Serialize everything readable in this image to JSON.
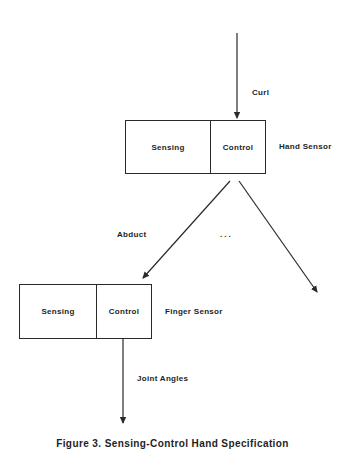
{
  "diagram": {
    "input_label": "Curl",
    "hand_sensor": {
      "name": "Hand Sensor",
      "left_cell": "Sensing",
      "right_cell": "Control"
    },
    "branch_label": "Abduct",
    "ellipsis": "...",
    "finger_sensor": {
      "name": "Finger Sensor",
      "left_cell": "Sensing",
      "right_cell": "Control"
    },
    "output_label": "Joint Angles",
    "caption": "Figure 3. Sensing-Control Hand Specification",
    "colors": {
      "line": "#2a2a2a",
      "text": "#1e1e1e",
      "background": "#ffffff"
    }
  }
}
